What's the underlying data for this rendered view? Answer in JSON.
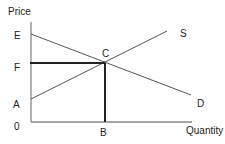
{
  "diagram": {
    "type": "supply-demand",
    "axes": {
      "y_label": "Price",
      "x_label": "Quantity",
      "origin_label": "0"
    },
    "points": {
      "E": "E",
      "F": "F",
      "A": "A",
      "C": "C",
      "B": "B"
    },
    "curves": {
      "supply": "S",
      "demand": "D"
    },
    "colors": {
      "axis": "#8a8a8a",
      "curve": "#555555",
      "guide": "#222222",
      "text": "#222222"
    }
  }
}
